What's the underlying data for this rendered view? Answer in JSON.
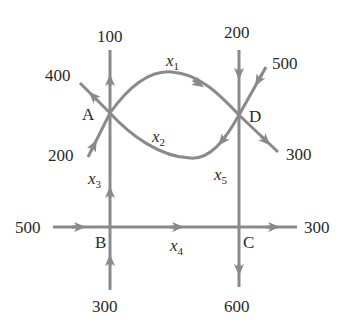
{
  "diagram": {
    "type": "network-flow",
    "edge_color": "#8a8a8a",
    "text_color": "#2a2a2a",
    "nodes": [
      {
        "id": "A",
        "label": "A"
      },
      {
        "id": "B",
        "label": "B"
      },
      {
        "id": "C",
        "label": "C"
      },
      {
        "id": "D",
        "label": "D"
      }
    ],
    "internal_edges": [
      {
        "var": "x",
        "sub": "1",
        "from": "A",
        "to": "D"
      },
      {
        "var": "x",
        "sub": "2",
        "from": "D",
        "to": "A"
      },
      {
        "var": "x",
        "sub": "3",
        "from": "B",
        "to": "A"
      },
      {
        "var": "x",
        "sub": "4",
        "from": "B",
        "to": "C"
      },
      {
        "var": "x",
        "sub": "5",
        "from": "D",
        "to": "C"
      }
    ],
    "external_flows": {
      "a_out_top": {
        "node": "A",
        "direction": "out",
        "value": "100"
      },
      "a_out_upleft": {
        "node": "A",
        "direction": "out",
        "value": "400"
      },
      "a_in_lowleft": {
        "node": "A",
        "direction": "in",
        "value": "200"
      },
      "d_in_top": {
        "node": "D",
        "direction": "in",
        "value": "200"
      },
      "d_in_upright": {
        "node": "D",
        "direction": "in",
        "value": "500"
      },
      "d_out_lowright": {
        "node": "D",
        "direction": "out",
        "value": "300"
      },
      "b_in_left": {
        "node": "B",
        "direction": "in",
        "value": "500"
      },
      "b_in_bottom": {
        "node": "B",
        "direction": "in",
        "value": "300"
      },
      "c_out_right": {
        "node": "C",
        "direction": "out",
        "value": "300"
      },
      "c_out_bottom": {
        "node": "C",
        "direction": "out",
        "value": "600"
      }
    }
  }
}
